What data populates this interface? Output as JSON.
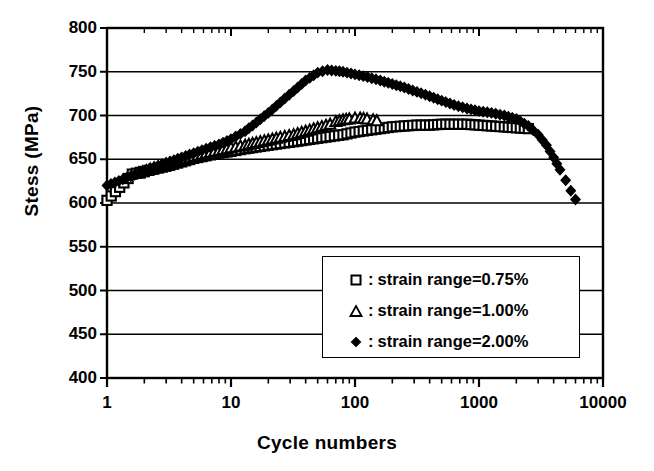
{
  "chart_data": {
    "type": "scatter",
    "title": "",
    "xlabel": "Cycle numbers",
    "ylabel": "Stess (MPa)",
    "xscale": "log",
    "yscale": "linear",
    "xlim": [
      1,
      10000
    ],
    "ylim": [
      400,
      800
    ],
    "xticks": [
      1,
      10,
      100,
      1000,
      10000
    ],
    "xticklabels": [
      "1",
      "10",
      "100",
      "1000",
      "10000"
    ],
    "yticks": [
      400,
      450,
      500,
      550,
      600,
      650,
      700,
      750,
      800
    ],
    "yticklabels": [
      "400",
      "450",
      "500",
      "550",
      "600",
      "650",
      "700",
      "750",
      "800"
    ],
    "grid": "horizontal",
    "legend_position": "lower-right",
    "series": [
      {
        "name": ": strain range=0.75%",
        "label": "strain range=0.75%",
        "marker": "open-square",
        "marker_fill": "#ffffff",
        "marker_edge": "#000000",
        "points": [
          [
            1,
            603
          ],
          [
            1.6,
            633
          ],
          [
            2,
            636
          ],
          [
            2.6,
            640
          ],
          [
            3.2,
            643
          ],
          [
            4,
            647
          ],
          [
            5,
            651
          ],
          [
            6.3,
            654
          ],
          [
            8,
            657
          ],
          [
            10,
            659
          ],
          [
            13,
            662
          ],
          [
            16,
            664
          ],
          [
            20,
            666
          ],
          [
            25,
            668
          ],
          [
            32,
            670
          ],
          [
            40,
            672
          ],
          [
            50,
            674
          ],
          [
            63,
            676
          ],
          [
            80,
            678
          ],
          [
            100,
            681
          ],
          [
            126,
            683
          ],
          [
            160,
            685
          ],
          [
            200,
            687
          ],
          [
            250,
            688
          ],
          [
            316,
            689
          ],
          [
            400,
            689
          ],
          [
            500,
            690
          ],
          [
            630,
            690
          ],
          [
            800,
            690
          ],
          [
            1000,
            689
          ],
          [
            1260,
            688
          ],
          [
            1600,
            687
          ],
          [
            2000,
            686
          ],
          [
            2500,
            685
          ]
        ]
      },
      {
        "name": ": strain range=1.00%",
        "label": "strain range=1.00%",
        "marker": "open-triangle",
        "marker_fill": "#ffffff",
        "marker_edge": "#000000",
        "points": [
          [
            1.8,
            634
          ],
          [
            2.4,
            640
          ],
          [
            3,
            644
          ],
          [
            4,
            649
          ],
          [
            5,
            653
          ],
          [
            6.3,
            657
          ],
          [
            8,
            660
          ],
          [
            10,
            663
          ],
          [
            13,
            666
          ],
          [
            16,
            669
          ],
          [
            20,
            672
          ],
          [
            25,
            675
          ],
          [
            32,
            678
          ],
          [
            40,
            682
          ],
          [
            50,
            686
          ],
          [
            63,
            690
          ],
          [
            70,
            693
          ],
          [
            80,
            695
          ],
          [
            90,
            696
          ],
          [
            100,
            697
          ],
          [
            110,
            697
          ],
          [
            125,
            696
          ],
          [
            140,
            695
          ],
          [
            150,
            694
          ]
        ]
      },
      {
        "name": ": strain range=2.00%",
        "label": "strain range=2.00%",
        "marker": "filled-diamond",
        "marker_fill": "#000000",
        "marker_edge": "#000000",
        "points": [
          [
            1,
            620
          ],
          [
            1.8,
            634
          ],
          [
            2.4,
            641
          ],
          [
            3,
            646
          ],
          [
            4,
            652
          ],
          [
            5,
            657
          ],
          [
            6.3,
            662
          ],
          [
            8,
            667
          ],
          [
            10,
            673
          ],
          [
            13,
            682
          ],
          [
            16,
            692
          ],
          [
            20,
            703
          ],
          [
            25,
            715
          ],
          [
            32,
            728
          ],
          [
            40,
            740
          ],
          [
            50,
            749
          ],
          [
            60,
            752
          ],
          [
            70,
            751
          ],
          [
            80,
            750
          ],
          [
            100,
            747
          ],
          [
            126,
            744
          ],
          [
            160,
            740
          ],
          [
            200,
            736
          ],
          [
            250,
            732
          ],
          [
            316,
            727
          ],
          [
            400,
            722
          ],
          [
            500,
            717
          ],
          [
            630,
            712
          ],
          [
            800,
            708
          ],
          [
            1000,
            705
          ],
          [
            1260,
            703
          ],
          [
            1600,
            700
          ],
          [
            2000,
            696
          ],
          [
            2500,
            688
          ],
          [
            3000,
            678
          ],
          [
            3500,
            666
          ],
          [
            4000,
            652
          ],
          [
            4500,
            638
          ],
          [
            5000,
            626
          ],
          [
            5500,
            614
          ],
          [
            6000,
            604
          ]
        ]
      }
    ]
  },
  "axis": {
    "y_title": "Stess (MPa)",
    "x_title": "Cycle numbers"
  },
  "legend": {
    "separator": ":",
    "rows": [
      {
        "marker": "open-square",
        "sep": ":",
        "text": "strain range=0.75%"
      },
      {
        "marker": "open-triangle",
        "sep": ":",
        "text": "strain range=1.00%"
      },
      {
        "marker": "filled-diamond",
        "sep": ":",
        "text": "strain range=2.00%"
      }
    ]
  },
  "colors": {
    "axis": "#000000",
    "grid": "#000000",
    "background": "#ffffff"
  }
}
